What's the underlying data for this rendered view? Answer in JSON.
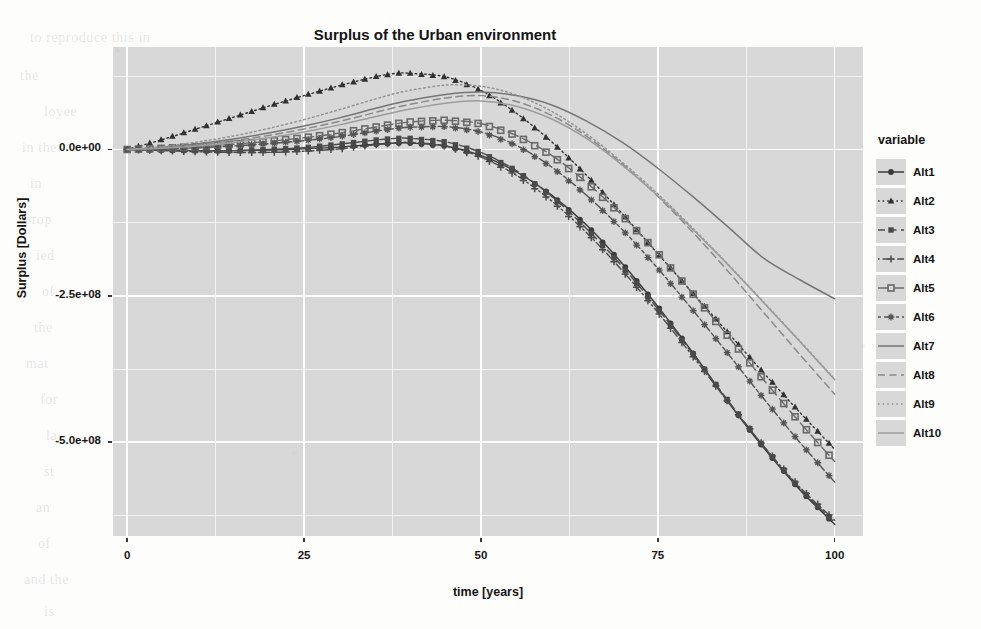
{
  "chart_data": {
    "type": "line",
    "title": "Surplus of the Urban environment",
    "xlabel": "time [years]",
    "ylabel": "Surplus [Dollars]",
    "xlim": [
      -2,
      104
    ],
    "ylim": [
      -660000000,
      175000000
    ],
    "xticks": [
      "0",
      "25",
      "50",
      "75",
      "100"
    ],
    "xtick_values": [
      0,
      25,
      50,
      75,
      100
    ],
    "yticks": [
      "0.0e+00",
      "-2.5e+08",
      "-5.0e+08"
    ],
    "ytick_values": [
      0,
      -250000000,
      -500000000
    ],
    "grid": true,
    "grid_color": "#ffffff",
    "panel_color": "#d8d8d8",
    "legend_position": "right",
    "legend_title": "variable",
    "x": [
      0,
      5,
      10,
      15,
      20,
      25,
      30,
      35,
      38,
      40,
      45,
      50,
      55,
      60,
      65,
      70,
      75,
      80,
      85,
      90,
      95,
      100
    ],
    "series": [
      {
        "name": "Alt1",
        "marker": "filled-circle",
        "dash": "solid",
        "color": "#3a3a3a",
        "values": [
          0,
          -1000000,
          -2000000,
          -2000000,
          -1000000,
          1000000,
          4000000,
          9000000,
          11000000,
          11000000,
          6000000,
          -10000000,
          -38000000,
          -78000000,
          -130000000,
          -195000000,
          -268000000,
          -348000000,
          -432000000,
          -510000000,
          -580000000,
          -640000000
        ]
      },
      {
        "name": "Alt2",
        "marker": "filled-triangle",
        "dash": "dotted",
        "color": "#303030",
        "values": [
          0,
          17000000,
          36000000,
          55000000,
          74000000,
          92000000,
          109000000,
          124000000,
          130000000,
          130000000,
          124000000,
          101000000,
          62000000,
          13000000,
          -45000000,
          -110000000,
          -178000000,
          -246000000,
          -314000000,
          -382000000,
          -448000000,
          -512000000
        ]
      },
      {
        "name": "Alt3",
        "marker": "filled-square",
        "dash": "dashed",
        "color": "#4a4a4a",
        "values": [
          0,
          -1000000,
          -2000000,
          -2000000,
          0,
          3000000,
          9000000,
          16000000,
          19000000,
          19000000,
          13000000,
          -5000000,
          -36000000,
          -80000000,
          -136000000,
          -200000000,
          -272000000,
          -350000000,
          -430000000,
          -508000000,
          -578000000,
          -637000000
        ]
      },
      {
        "name": "Alt4",
        "marker": "plus",
        "dash": "dotdash",
        "color": "#4a4a4a",
        "values": [
          0,
          -2000000,
          -4000000,
          -5000000,
          -5000000,
          -3000000,
          1000000,
          8000000,
          11000000,
          12000000,
          6000000,
          -13000000,
          -44000000,
          -88000000,
          -143000000,
          -207000000,
          -278000000,
          -354000000,
          -432000000,
          -507000000,
          -576000000,
          -633000000
        ]
      },
      {
        "name": "Alt5",
        "marker": "open-square",
        "dash": "longdash",
        "color": "#6a6a6a",
        "values": [
          0,
          2000000,
          5000000,
          9000000,
          14000000,
          20000000,
          28000000,
          38000000,
          44000000,
          47000000,
          50000000,
          44000000,
          24000000,
          -10000000,
          -57000000,
          -113000000,
          -177000000,
          -247000000,
          -320000000,
          -394000000,
          -465000000,
          -533000000
        ]
      },
      {
        "name": "Alt6",
        "marker": "asterisk",
        "dash": "twodash",
        "color": "#545454",
        "values": [
          0,
          1000000,
          3000000,
          6000000,
          10000000,
          15000000,
          22000000,
          31000000,
          36000000,
          38000000,
          39000000,
          30000000,
          7000000,
          -30000000,
          -79000000,
          -137000000,
          -203000000,
          -275000000,
          -350000000,
          -426000000,
          -499000000,
          -568000000
        ]
      },
      {
        "name": "Alt7",
        "marker": "none",
        "dash": "solid",
        "color": "#767676",
        "values": [
          0,
          4000000,
          10000000,
          18000000,
          28000000,
          40000000,
          54000000,
          70000000,
          79000000,
          84000000,
          94000000,
          98000000,
          92000000,
          76000000,
          48000000,
          12000000,
          -32000000,
          -81000000,
          -133000000,
          -186000000,
          -222000000,
          -255000000
        ]
      },
      {
        "name": "Alt8",
        "marker": "none",
        "dash": "dashed",
        "color": "#8a8a8a",
        "values": [
          0,
          3000000,
          8000000,
          15000000,
          24000000,
          35000000,
          48000000,
          63000000,
          72000000,
          77000000,
          88000000,
          92000000,
          82000000,
          58000000,
          22000000,
          -25000000,
          -80000000,
          -142000000,
          -209000000,
          -279000000,
          -349000000,
          -418000000
        ]
      },
      {
        "name": "Alt9",
        "marker": "none",
        "dash": "dotted",
        "color": "#939393",
        "values": [
          0,
          5000000,
          13000000,
          23000000,
          36000000,
          51000000,
          68000000,
          86000000,
          96000000,
          101000000,
          110000000,
          108000000,
          93000000,
          65000000,
          26000000,
          -22000000,
          -76000000,
          -135000000,
          -197000000,
          -261000000,
          -326000000,
          -392000000
        ]
      },
      {
        "name": "Alt10",
        "marker": "none",
        "dash": "solid",
        "color": "#9c9c9c",
        "values": [
          0,
          2000000,
          6000000,
          12000000,
          20000000,
          30000000,
          42000000,
          56000000,
          64000000,
          69000000,
          79000000,
          83000000,
          74000000,
          52000000,
          18000000,
          -27000000,
          -79000000,
          -137000000,
          -198000000,
          -262000000,
          -327000000,
          -393000000
        ]
      }
    ]
  },
  "ghost_text": [
    {
      "text": "to reproduce this in",
      "x": 30,
      "y": 30
    },
    {
      "text": "res",
      "x": 430,
      "y": 28
    },
    {
      "text": "the",
      "x": 20,
      "y": 68
    },
    {
      "text": "loyee",
      "x": 44,
      "y": 104
    },
    {
      "text": "in the",
      "x": 22,
      "y": 140
    },
    {
      "text": "in",
      "x": 30,
      "y": 176
    },
    {
      "text": "prop",
      "x": 24,
      "y": 212
    },
    {
      "text": "ied",
      "x": 36,
      "y": 248
    },
    {
      "text": "of",
      "x": 42,
      "y": 284
    },
    {
      "text": "the",
      "x": 34,
      "y": 320
    },
    {
      "text": "mat",
      "x": 26,
      "y": 356
    },
    {
      "text": "for",
      "x": 40,
      "y": 392
    },
    {
      "text": "la",
      "x": 46,
      "y": 428
    },
    {
      "text": "st",
      "x": 44,
      "y": 464
    },
    {
      "text": "an",
      "x": 36,
      "y": 500
    },
    {
      "text": "of",
      "x": 38,
      "y": 536
    },
    {
      "text": "and the",
      "x": 24,
      "y": 572
    },
    {
      "text": "is",
      "x": 44,
      "y": 604
    }
  ]
}
